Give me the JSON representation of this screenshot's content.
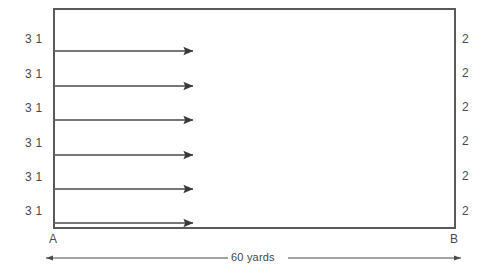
{
  "figure": {
    "title_alt": "Rectangle field diagram with flow arrows",
    "rect": {
      "x": 54,
      "y": 9,
      "width": 401,
      "height": 219,
      "stroke": "#5a5a5a",
      "stroke_width": 2,
      "fill": "#ffffff"
    },
    "arrows": {
      "count": 6,
      "start_x": 55,
      "end_x": 197,
      "stroke": "#4a4a4a",
      "stroke_width": 1.6,
      "rows_y": [
        51,
        86,
        120,
        155,
        189,
        223
      ]
    },
    "left_labels": [
      {
        "text": "3 1",
        "x": 25,
        "y": 33
      },
      {
        "text": "3 1",
        "x": 25,
        "y": 68
      },
      {
        "text": "3 1",
        "x": 25,
        "y": 102
      },
      {
        "text": "3 1",
        "x": 25,
        "y": 137
      },
      {
        "text": "3 1",
        "x": 25,
        "y": 171
      },
      {
        "text": "3 1",
        "x": 25,
        "y": 205
      }
    ],
    "right_labels": [
      {
        "text": "2",
        "x": 462,
        "y": 33
      },
      {
        "text": "2",
        "x": 462,
        "y": 67
      },
      {
        "text": "2",
        "x": 462,
        "y": 101
      },
      {
        "text": "2",
        "x": 462,
        "y": 135
      },
      {
        "text": "2",
        "x": 462,
        "y": 170
      },
      {
        "text": "2",
        "x": 462,
        "y": 205
      }
    ],
    "corner_labels": {
      "left": {
        "text": "A",
        "x": 49,
        "y": 233
      },
      "right": {
        "text": "B",
        "x": 450,
        "y": 233
      }
    },
    "dimension": {
      "label": "60 yards",
      "line_y": 258,
      "start_x": 45,
      "end_x": 462,
      "stroke": "#4a4a4a",
      "stroke_width": 1,
      "label_center_x": 254,
      "label_y": 252
    }
  }
}
